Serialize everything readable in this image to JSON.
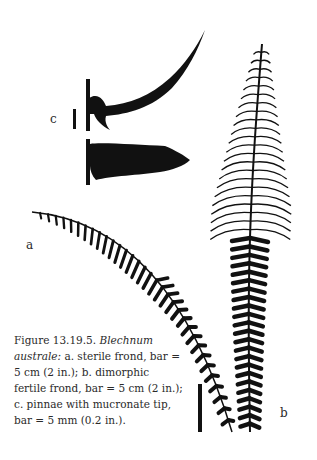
{
  "figure": {
    "panel_labels": {
      "a": "a",
      "b": "b",
      "c": "c"
    },
    "caption": {
      "figure_number": "Figure 13.19.5.",
      "species": "Blechnum australe:",
      "part_a": "a. sterile frond, bar = 5 cm (2 in.);",
      "part_b": "b. dimorphic fertile frond, bar = 5 cm (2 in.);",
      "part_c": "c. pinnae with mucronate tip, bar = 5 mm (0.2 in.)."
    },
    "colors": {
      "ink": "#111111",
      "background": "#ffffff",
      "text": "#2a2a2a"
    }
  }
}
